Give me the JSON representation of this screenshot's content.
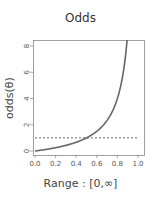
{
  "chart_data": {
    "type": "line",
    "title": "Odds",
    "xlabel": "Range : [0,∞]",
    "ylabel": "odds(θ)",
    "xlim": [
      0.0,
      1.0
    ],
    "ylim": [
      0,
      8
    ],
    "x_ticks": [
      "0.0",
      "0.2",
      "0.4",
      "0.6",
      "0.8",
      "1.0"
    ],
    "y_ticks": [
      "0",
      "2",
      "4",
      "6",
      "8"
    ],
    "grid": false,
    "legend": null,
    "series": [
      {
        "name": "odds(θ) = θ/(1-θ)",
        "style": "solid",
        "color": "#666666",
        "x": [
          0.0,
          0.1,
          0.2,
          0.3,
          0.4,
          0.5,
          0.6,
          0.7,
          0.8,
          0.85,
          0.89
        ],
        "values": [
          0.0,
          0.11,
          0.25,
          0.43,
          0.67,
          1.0,
          1.5,
          2.33,
          4.0,
          5.67,
          8.09
        ]
      },
      {
        "name": "odds = 1 reference",
        "style": "dashed",
        "color": "#555555",
        "x": [
          0.0,
          1.0
        ],
        "values": [
          1,
          1
        ]
      }
    ]
  },
  "labels": {
    "title": "Odds",
    "xlabel": "Range : [0,∞]",
    "ylabel": "odds(θ)"
  }
}
